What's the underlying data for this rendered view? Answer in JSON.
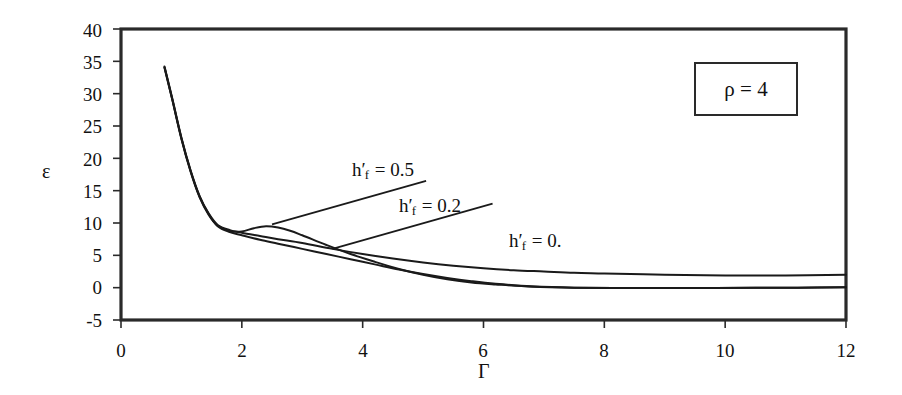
{
  "chart_data": {
    "type": "line",
    "title": "",
    "xlabel": "Γ",
    "ylabel": "ε",
    "xlim": [
      0,
      12
    ],
    "ylim": [
      -5,
      40
    ],
    "xticks": [
      "0",
      "2",
      "4",
      "6",
      "8",
      "10",
      "12"
    ],
    "yticks": [
      "40",
      "35",
      "30",
      "25",
      "20",
      "15",
      "10",
      "5",
      "0",
      "-5"
    ],
    "grid": false,
    "legend_position": "inline-annotations",
    "annotation_box": "ρ = 4",
    "series": [
      {
        "name": "h'_f = 0.5",
        "label_html": "h<span class=\"prime\">'</span><sub>f</sub> = 0.5",
        "color": "#1a1a1a",
        "x": [
          0.72,
          0.85,
          1.0,
          1.15,
          1.3,
          1.45,
          1.6,
          1.8,
          2.0,
          2.2,
          2.4,
          2.6,
          2.8,
          3.0,
          3.4,
          3.8,
          4.2,
          4.6,
          5.0,
          5.4,
          5.8,
          6.2,
          6.8,
          7.5,
          8.5,
          9.5,
          10.5,
          11.2,
          12.0
        ],
        "y": [
          34.0,
          29.0,
          23.0,
          18.0,
          14.0,
          11.3,
          9.6,
          8.8,
          8.7,
          9.2,
          9.5,
          9.3,
          8.8,
          8.1,
          6.6,
          5.2,
          4.0,
          2.9,
          2.0,
          1.3,
          0.8,
          0.5,
          0.15,
          0.0,
          -0.05,
          -0.05,
          -0.02,
          0.0,
          0.05
        ]
      },
      {
        "name": "h'_f = 0.2",
        "label_html": "h<span class=\"prime\">'</span><sub>f</sub> = 0.2",
        "color": "#1a1a1a",
        "x": [
          0.72,
          0.85,
          1.0,
          1.15,
          1.3,
          1.45,
          1.6,
          1.8,
          2.0,
          2.3,
          2.6,
          3.0,
          3.4,
          3.8,
          4.2,
          4.6,
          5.0,
          5.4,
          5.8,
          6.2,
          6.8,
          7.5,
          8.5,
          9.5,
          10.5,
          11.2,
          12.0
        ],
        "y": [
          34.2,
          29.2,
          23.2,
          18.2,
          14.2,
          11.4,
          9.5,
          8.6,
          8.1,
          7.4,
          6.8,
          6.0,
          5.2,
          4.4,
          3.6,
          2.8,
          2.1,
          1.5,
          1.0,
          0.6,
          0.2,
          0.0,
          -0.05,
          -0.05,
          -0.02,
          0.0,
          0.05
        ]
      },
      {
        "name": "h'_f = 0.",
        "label_html": "h<span class=\"prime\">'</span><sub>f</sub> = 0.",
        "color": "#1a1a1a",
        "x": [
          0.72,
          0.85,
          1.0,
          1.15,
          1.3,
          1.45,
          1.6,
          1.8,
          2.0,
          2.3,
          2.6,
          3.0,
          3.5,
          4.0,
          4.5,
          5.0,
          5.5,
          6.0,
          6.5,
          7.0,
          7.5,
          8.0,
          9.0,
          10.0,
          11.0,
          12.0
        ],
        "y": [
          34.1,
          29.1,
          23.1,
          18.1,
          14.1,
          11.5,
          9.7,
          8.9,
          8.5,
          8.0,
          7.5,
          6.9,
          6.0,
          5.2,
          4.5,
          3.9,
          3.4,
          3.0,
          2.7,
          2.5,
          2.3,
          2.2,
          2.0,
          1.9,
          1.9,
          2.0
        ]
      }
    ],
    "annotations": [
      {
        "name": "label-hf-05",
        "text": "h'_f = 0.5",
        "leader_from": [
          5.05,
          16.5
        ],
        "leader_to": [
          2.5,
          9.8
        ]
      },
      {
        "name": "label-hf-02",
        "text": "h'_f = 0.2",
        "leader_from": [
          6.15,
          13.0
        ],
        "leader_to": [
          3.5,
          6.0
        ]
      },
      {
        "name": "label-hf-0",
        "text": "h'_f = 0.",
        "leader_from": null,
        "leader_to": null
      }
    ]
  },
  "axes": {
    "ylabel": "ε",
    "xlabel": "Γ",
    "yticks": [
      {
        "value": 40,
        "label": "40"
      },
      {
        "value": 35,
        "label": "35"
      },
      {
        "value": 30,
        "label": "30"
      },
      {
        "value": 25,
        "label": "25"
      },
      {
        "value": 20,
        "label": "20"
      },
      {
        "value": 15,
        "label": "15"
      },
      {
        "value": 10,
        "label": "10"
      },
      {
        "value": 5,
        "label": "5"
      },
      {
        "value": 0,
        "label": "0"
      },
      {
        "value": -5,
        "label": "-5"
      }
    ],
    "xticks": [
      {
        "value": 0,
        "label": "0"
      },
      {
        "value": 2,
        "label": "2"
      },
      {
        "value": 4,
        "label": "4"
      },
      {
        "value": 6,
        "label": "6"
      },
      {
        "value": 8,
        "label": "8"
      },
      {
        "value": 10,
        "label": "10"
      },
      {
        "value": 12,
        "label": "12"
      }
    ]
  },
  "param_box": {
    "text": "ρ = 4"
  },
  "curve_labels": {
    "hf_05": "h'_f = 0.5",
    "hf_02": "h'_f = 0.2",
    "hf_0": "h'_f = 0."
  },
  "colors": {
    "curve": "#1a1a1a",
    "frame": "#2a2a2a",
    "background": "#ffffff"
  }
}
